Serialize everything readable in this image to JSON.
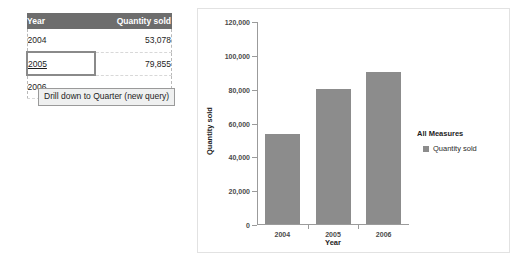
{
  "table": {
    "columns": [
      "Year",
      "Quantity sold"
    ],
    "rows": [
      {
        "year": "2004",
        "quantity": "53,078"
      },
      {
        "year": "2005",
        "quantity": "79,855"
      },
      {
        "year": "2006",
        "quantity": ""
      }
    ]
  },
  "tooltip": {
    "text": "Drill down to Quarter (new query)"
  },
  "legend": {
    "title": "All Measures",
    "items": [
      {
        "label": "Quantity sold",
        "color": "#8c8c8c"
      }
    ]
  },
  "colors": {
    "bar": "#8c8c8c",
    "table_header_bg": "#6d6d6d",
    "selection_border": "#8a8a8a"
  },
  "chart_data": {
    "type": "bar",
    "title": "",
    "categories": [
      "2004",
      "2005",
      "2006"
    ],
    "values": [
      53078,
      79855,
      90000
    ],
    "series": [
      {
        "name": "Quantity sold",
        "values": [
          53078,
          79855,
          90000
        ]
      }
    ],
    "xlabel": "Year",
    "ylabel": "Quantity sold",
    "ylim": [
      0,
      120000
    ],
    "yticks": [
      "0",
      "20,000",
      "40,000",
      "60,000",
      "80,000",
      "100,000",
      "120,000"
    ],
    "ytick_values": [
      0,
      20000,
      40000,
      60000,
      80000,
      100000,
      120000
    ],
    "grid": false,
    "legend_position": "right"
  }
}
